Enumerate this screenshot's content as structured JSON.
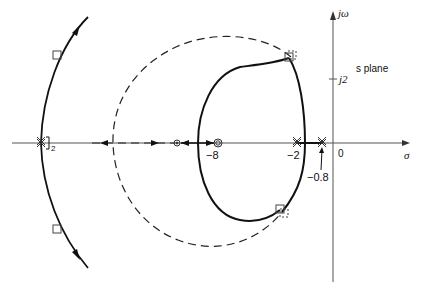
{
  "diagram": {
    "type": "root-locus",
    "plane_label": "s plane",
    "axes": {
      "real_label": "σ",
      "imag_label": "jω",
      "origin_label": "0",
      "imag_tick_label": "j2"
    },
    "real_axis_labels": {
      "zero_minus8": "−8",
      "pole_minus2": "−2",
      "pole_minus0_8": "−0.8",
      "left_crossing_subscript": "2"
    },
    "markers": {
      "poles": [
        "-2 (double)",
        "-0.8 (double)",
        "left asymptote crossing (double)"
      ],
      "zeros": [
        "-8 (double)",
        "second zero left of -8"
      ],
      "closed_loop_roots_solid": "squares",
      "closed_loop_roots_dashed": "dashed squares"
    },
    "curves": {
      "solid": "root locus (oval around -8 zero and left branches)",
      "dashed": "root locus (large circle)"
    }
  }
}
